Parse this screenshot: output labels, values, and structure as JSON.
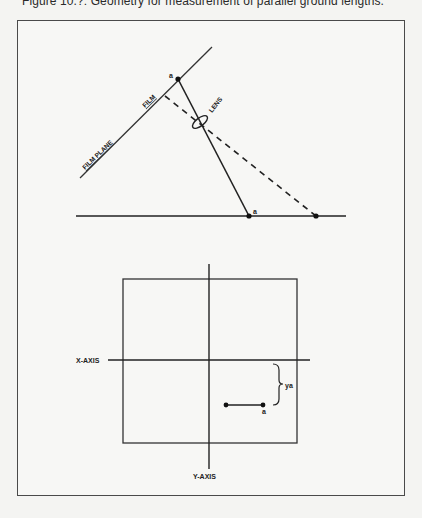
{
  "caption": "Figure 10.?: Geometry for measurement of parallel ground lengths.",
  "top_diagram": {
    "labels": {
      "film_plane": "FILM PLANE",
      "film": "FILM",
      "lens": "LENS",
      "film_point": "a",
      "ground_point": "a"
    }
  },
  "bottom_diagram": {
    "labels": {
      "x_axis": "X-AXIS",
      "y_axis": "Y-AXIS",
      "ya": "ya",
      "point": "a"
    }
  },
  "colors": {
    "ink": "#222222",
    "paper": "#f4f4f2",
    "frame": "#4a4a4a"
  }
}
